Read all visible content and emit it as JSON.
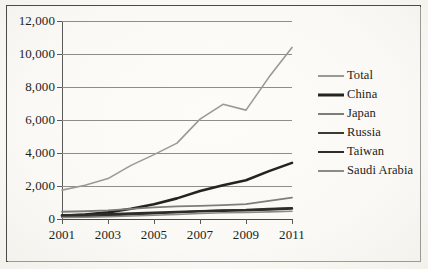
{
  "chart_data": {
    "type": "line",
    "title": "",
    "subtitle": "",
    "xlabel": "",
    "ylabel": "",
    "xlim": [
      2001,
      2011
    ],
    "ylim": [
      0,
      12000
    ],
    "grid": true,
    "legend_position": "right",
    "x": [
      2001,
      2002,
      2003,
      2004,
      2005,
      2006,
      2007,
      2008,
      2009,
      2010,
      2011
    ],
    "y_ticks": [
      0,
      2000,
      4000,
      6000,
      8000,
      10000,
      12000
    ],
    "y_tick_labels": [
      "0",
      "2,000",
      "4,000",
      "6,000",
      "8,000",
      "10,000",
      "12,000"
    ],
    "x_ticks": [
      2001,
      2003,
      2005,
      2007,
      2009,
      2011
    ],
    "x_tick_labels": [
      "2001",
      "2003",
      "2005",
      "2007",
      "2009",
      "2011"
    ],
    "series": [
      {
        "name": "Total",
        "color": "#9a9a95",
        "width": 1.6,
        "values": [
          1750,
          2050,
          2450,
          3250,
          3900,
          4600,
          6050,
          6950,
          6600,
          8600,
          10400
        ]
      },
      {
        "name": "China",
        "color": "#232320",
        "width": 2.6,
        "values": [
          200,
          270,
          400,
          620,
          900,
          1250,
          1700,
          2050,
          2350,
          2900,
          3400
        ]
      },
      {
        "name": "Japan",
        "color": "#7e7e79",
        "width": 1.8,
        "values": [
          440,
          470,
          520,
          610,
          700,
          760,
          800,
          840,
          900,
          1100,
          1300
        ]
      },
      {
        "name": "Russia",
        "color": "#3a3a36",
        "width": 1.8,
        "values": [
          120,
          150,
          200,
          260,
          330,
          400,
          480,
          540,
          560,
          620,
          680
        ]
      },
      {
        "name": "Taiwan",
        "color": "#2c2c28",
        "width": 2.4,
        "values": [
          230,
          250,
          290,
          330,
          380,
          420,
          470,
          500,
          520,
          580,
          640
        ]
      },
      {
        "name": "Saudi Arabia",
        "color": "#8b8b86",
        "width": 1.6,
        "values": [
          90,
          110,
          140,
          180,
          230,
          280,
          330,
          380,
          390,
          430,
          470
        ]
      }
    ]
  }
}
